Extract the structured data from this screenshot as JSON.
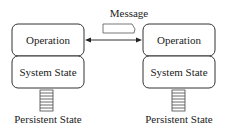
{
  "diagram": {
    "message_label": "Message",
    "nodes": [
      {
        "operation": "Operation",
        "system_state": "System State",
        "persistent_state": "Persistent State"
      },
      {
        "operation": "Operation",
        "system_state": "System State",
        "persistent_state": "Persistent State"
      }
    ],
    "colors": {
      "stroke": "#333333",
      "fill": "#ffffff"
    }
  }
}
